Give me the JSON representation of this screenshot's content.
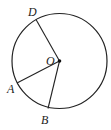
{
  "diagram": {
    "type": "circle-geometry",
    "circle": {
      "cx": 59.5,
      "cy": 61,
      "r": 47.5,
      "stroke": "#222222"
    },
    "center": {
      "label": "O",
      "x": 59.5,
      "y": 61
    },
    "points": [
      {
        "label": "D",
        "x": 36,
        "y": 19.5,
        "label_x": 28,
        "label_y": 16
      },
      {
        "label": "A",
        "x": 17,
        "y": 83,
        "label_x": 7,
        "label_y": 93
      },
      {
        "label": "B",
        "x": 48,
        "y": 108.5,
        "label_x": 41,
        "label_y": 124
      }
    ],
    "segments": [
      "OD",
      "OA",
      "OB"
    ]
  }
}
